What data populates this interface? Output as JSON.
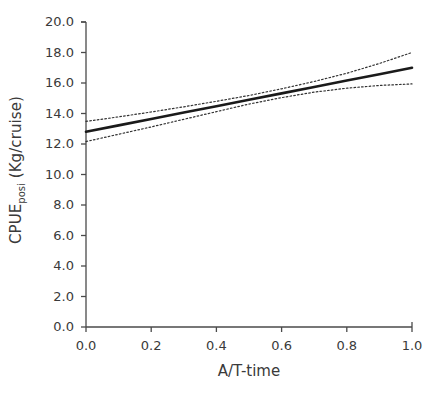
{
  "chart_data": {
    "type": "line",
    "title": "",
    "xlabel": "A/T-time",
    "ylabel_main": "CPUE",
    "ylabel_sub": "posi",
    "ylabel_unit": " (Kg/cruise)",
    "ylabel_full": "CPUE_posi (Kg/cruise)",
    "xlim": [
      0.0,
      1.0
    ],
    "ylim": [
      0.0,
      20.0
    ],
    "xticks": [
      "0.0",
      "0.2",
      "0.4",
      "0.6",
      "0.8",
      "1.0"
    ],
    "xtick_values": [
      0.0,
      0.2,
      0.4,
      0.6,
      0.8,
      1.0
    ],
    "yticks": [
      "0.0",
      "2.0",
      "4.0",
      "6.0",
      "8.0",
      "10.0",
      "12.0",
      "14.0",
      "16.0",
      "18.0",
      "20.0"
    ],
    "ytick_values": [
      0.0,
      2.0,
      4.0,
      6.0,
      8.0,
      10.0,
      12.0,
      14.0,
      16.0,
      18.0,
      20.0
    ],
    "grid": false,
    "legend": "none",
    "x": [
      0.0,
      0.1,
      0.2,
      0.3,
      0.4,
      0.5,
      0.6,
      0.7,
      0.8,
      0.9,
      1.0
    ],
    "series": [
      {
        "name": "fitted",
        "style": "solid",
        "color": "#1a1a1a",
        "width": 2.6,
        "values": [
          12.8,
          13.22,
          13.64,
          14.06,
          14.48,
          14.9,
          15.32,
          15.74,
          16.16,
          16.58,
          17.0
        ]
      },
      {
        "name": "upper-confidence-limit",
        "style": "dotted",
        "color": "#333333",
        "width": 1.2,
        "values": [
          13.48,
          13.78,
          14.1,
          14.44,
          14.8,
          15.18,
          15.62,
          16.1,
          16.64,
          17.28,
          18.0
        ]
      },
      {
        "name": "lower-confidence-limit",
        "style": "dotted",
        "color": "#333333",
        "width": 1.2,
        "values": [
          12.16,
          12.64,
          13.12,
          13.62,
          14.12,
          14.62,
          15.04,
          15.4,
          15.66,
          15.84,
          15.94
        ]
      }
    ]
  },
  "axes": {
    "tick_color": "#4a4a4a",
    "spine_color": "#4a4a4a",
    "background": "#ffffff"
  }
}
